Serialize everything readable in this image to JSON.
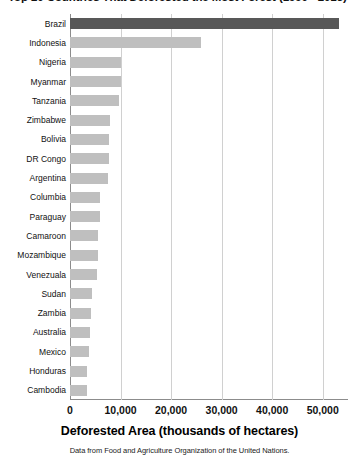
{
  "chart_data": {
    "type": "bar",
    "orientation": "horizontal",
    "title": "Top 20 Countries That Deforested the Most Forest (1990 - 2015)",
    "xlabel": "Deforested Area (thousands of hectares)",
    "ylabel": "",
    "source_note": "Data from Food and Agriculture Organization of the United Nations.",
    "categories": [
      "Brazil",
      "Indonesia",
      "Nigeria",
      "Myanmar",
      "Tanzania",
      "Zimbabwe",
      "Bolivia",
      "DR Congo",
      "Argentina",
      "Columbia",
      "Paraguay",
      "Camaroon",
      "Mozambique",
      "Venezuala",
      "Sudan",
      "Zambia",
      "Australia",
      "Mexico",
      "Honduras",
      "Cambodia"
    ],
    "values": [
      53281,
      26000,
      10000,
      10000,
      9600,
      8000,
      7800,
      7700,
      7500,
      6000,
      5900,
      5600,
      5500,
      5300,
      4400,
      4200,
      4000,
      3700,
      3400,
      3300
    ],
    "xlim": [
      0,
      55000
    ],
    "xticks": [
      0,
      10000,
      20000,
      30000,
      40000,
      50000
    ],
    "xtick_labels": [
      "0",
      "10,000",
      "20,000",
      "30,000",
      "40,000",
      "50,000"
    ],
    "grid": "vertical",
    "legend": "none",
    "highlight_category": "Brazil",
    "colors": {
      "bar": "#bfbfbf",
      "bar_highlight": "#585858",
      "gridline": "#d0d0d0",
      "axis": "#8c8c8c",
      "text": "#111111",
      "background": "#ffffff"
    }
  }
}
